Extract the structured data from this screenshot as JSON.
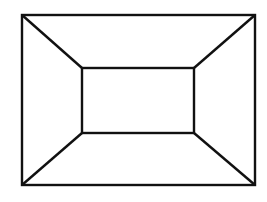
{
  "diagram": {
    "type": "frustum-top-view",
    "stroke_color": "#111111",
    "background": "#ffffff",
    "outer_rect": {
      "x": 22,
      "y": 15,
      "w": 233,
      "h": 170
    },
    "inner_rect": {
      "x": 82,
      "y": 68,
      "w": 112,
      "h": 65
    }
  }
}
